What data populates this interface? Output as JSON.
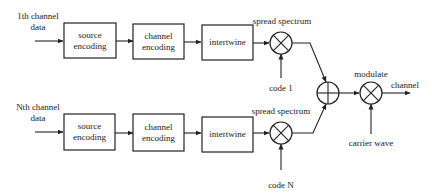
{
  "diagram": {
    "type": "block-diagram",
    "title": "",
    "branches": [
      {
        "input_label_line1": "1th channel",
        "input_label_line2": "data",
        "blocks": [
          "source|encoding",
          "channel|encoding",
          "intertwine"
        ],
        "source_line1": "source",
        "source_line2": "encoding",
        "channel_line1": "channel",
        "channel_line2": "encoding",
        "intertwine": "intertwine",
        "spread_label": "spread spectrum",
        "code_label": "code 1"
      },
      {
        "input_label_line1": "Nth channel",
        "input_label_line2": "data",
        "source_line1": "source",
        "source_line2": "encoding",
        "channel_line1": "channel",
        "channel_line2": "encoding",
        "intertwine": "intertwine",
        "spread_label": "spread spectrum",
        "code_label": "code N"
      }
    ],
    "combiner": {
      "symbol": "adder"
    },
    "modulator": {
      "label": "modulate",
      "carrier_label": "carrier wave",
      "output_label": "channel"
    }
  }
}
